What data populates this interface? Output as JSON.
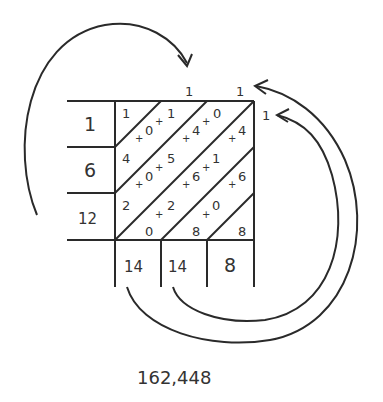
{
  "diagram": {
    "type": "lattice-multiplication",
    "row_labels": [
      "1",
      "6",
      "12"
    ],
    "column_sums": [
      "14",
      "14",
      "8"
    ],
    "top_carries": [
      "1",
      "1"
    ],
    "right_carry": "1",
    "result": "162,448",
    "cells": [
      [
        "1",
        "0",
        "1",
        "4",
        "0",
        "4"
      ],
      [
        "4",
        "0",
        "5",
        "6",
        "1",
        "6"
      ],
      [
        "2",
        "0",
        "2",
        "8",
        "0",
        "8"
      ]
    ],
    "diagonal_entries": {
      "r0c0_top": "1",
      "r0c0_bot": "4",
      "r0c1_top": "1",
      "r0c1_mid": "0",
      "r0c2_top": "0",
      "r0c2_mid": "4",
      "r0c2_right": "4",
      "r0c1_bot": "5",
      "r1c0_top": "4",
      "r1c0_mid": "0",
      "r1c0_bot": "2",
      "r1c1_mid": "5",
      "r1c1_low": "0",
      "r1c2_top": "1",
      "r1c2_mid": "6",
      "r1c2_right": "6",
      "r2c0_mid": "2",
      "r2c0_bot": "0",
      "r2c1_mid": "2",
      "r2c1_low": "8",
      "r2c2_mid": "0",
      "r2c2_right": "8"
    },
    "plus_sign": "+"
  }
}
